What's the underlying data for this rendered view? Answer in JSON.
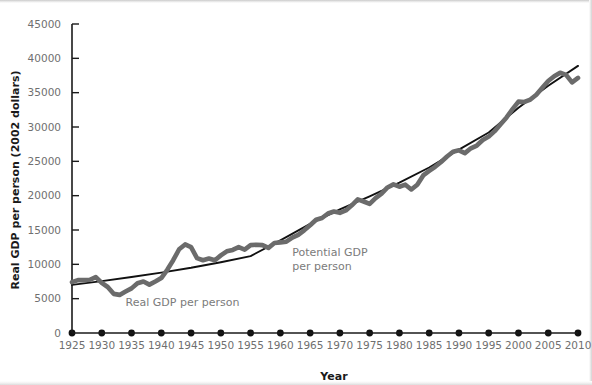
{
  "chart_data": {
    "type": "line",
    "title": "",
    "xlabel": "Year",
    "ylabel": "Real GDP per person (2002 dollars)",
    "xlim": [
      1925,
      2010
    ],
    "ylim": [
      0,
      45000
    ],
    "grid": false,
    "legend_position": "inline-annotations",
    "x_tick_labels": [
      "1925",
      "1930",
      "1935",
      "1940",
      "1945",
      "1950",
      "1955",
      "1960",
      "1965",
      "1970",
      "1975",
      "1980",
      "1985",
      "1990",
      "1995",
      "2000",
      "2005",
      "2010"
    ],
    "y_tick_labels": [
      "0",
      "5000",
      "10000",
      "15000",
      "20000",
      "25000",
      "30000",
      "35000",
      "40000",
      "45000"
    ],
    "x_ticks": [
      1925,
      1930,
      1935,
      1940,
      1945,
      1950,
      1955,
      1960,
      1965,
      1970,
      1975,
      1980,
      1985,
      1990,
      1995,
      2000,
      2005,
      2010
    ],
    "y_ticks": [
      0,
      5000,
      10000,
      15000,
      20000,
      25000,
      30000,
      35000,
      40000,
      45000
    ],
    "annotations": [
      {
        "name": "real-gdp-annotation",
        "text": "Real GDP per person",
        "x": 1934,
        "y": 3900
      },
      {
        "name": "potential-gdp-annotation-line1",
        "text": "Potential GDP",
        "x": 1962,
        "y": 11200
      },
      {
        "name": "potential-gdp-annotation-line2",
        "text": "per person",
        "x": 1962,
        "y": 9200
      }
    ],
    "series": [
      {
        "name": "Real GDP per person",
        "color": "#6b6b6b",
        "style": "thick-line",
        "x": [
          1925,
          1926,
          1927,
          1928,
          1929,
          1930,
          1931,
          1932,
          1933,
          1934,
          1935,
          1936,
          1937,
          1938,
          1939,
          1940,
          1941,
          1942,
          1943,
          1944,
          1945,
          1946,
          1947,
          1948,
          1949,
          1950,
          1951,
          1952,
          1953,
          1954,
          1955,
          1956,
          1957,
          1958,
          1959,
          1960,
          1961,
          1962,
          1963,
          1964,
          1965,
          1966,
          1967,
          1968,
          1969,
          1970,
          1971,
          1972,
          1973,
          1974,
          1975,
          1976,
          1977,
          1978,
          1979,
          1980,
          1981,
          1982,
          1983,
          1984,
          1985,
          1986,
          1987,
          1988,
          1989,
          1990,
          1991,
          1992,
          1993,
          1994,
          1995,
          1996,
          1997,
          1998,
          1999,
          2000,
          2001,
          2002,
          2003,
          2004,
          2005,
          2006,
          2007,
          2008,
          2009,
          2010
        ],
        "values": [
          7400,
          7700,
          7700,
          7750,
          8150,
          7300,
          6700,
          5700,
          5550,
          6050,
          6500,
          7250,
          7500,
          7050,
          7500,
          8000,
          9200,
          10600,
          12200,
          12900,
          12500,
          10900,
          10600,
          10850,
          10600,
          11300,
          11900,
          12100,
          12500,
          12150,
          12800,
          12850,
          12800,
          12400,
          13100,
          13200,
          13300,
          13900,
          14300,
          14950,
          15700,
          16500,
          16750,
          17400,
          17700,
          17500,
          17850,
          18600,
          19450,
          19150,
          18800,
          19650,
          20300,
          21200,
          21650,
          21300,
          21600,
          20900,
          21600,
          22950,
          23600,
          24200,
          24900,
          25700,
          26400,
          26600,
          26200,
          26900,
          27300,
          28100,
          28600,
          29400,
          30400,
          31400,
          32600,
          33700,
          33650,
          34000,
          34700,
          35700,
          36700,
          37400,
          37900,
          37600,
          36500,
          37150
        ]
      },
      {
        "name": "Potential GDP per person",
        "color": "#111111",
        "style": "thin-line",
        "x": [
          1925,
          1930,
          1935,
          1940,
          1945,
          1950,
          1955,
          1960,
          1965,
          1970,
          1975,
          1980,
          1985,
          1990,
          1995,
          2000,
          2005,
          2010
        ],
        "values": [
          7000,
          7550,
          8150,
          8800,
          9500,
          10300,
          11200,
          13500,
          15900,
          18000,
          19900,
          21900,
          24100,
          26700,
          29200,
          32800,
          36000,
          38900
        ]
      }
    ]
  }
}
